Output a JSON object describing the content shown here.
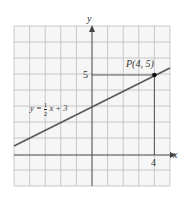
{
  "diagram": {
    "type": "line graph on coordinate grid",
    "axes": {
      "x_label": "x",
      "y_label": "y",
      "x_range": [
        -5,
        5
      ],
      "y_range": [
        -2,
        8
      ]
    },
    "equation": {
      "lhs": "y =",
      "frac_num": "1",
      "frac_den": "2",
      "rhs": "x + 3"
    },
    "point": {
      "label": "P(4, 5)",
      "x": 4,
      "y": 5
    },
    "ticks": {
      "x": "4",
      "y": "5"
    },
    "colors": {
      "grid": "#c8c8c8",
      "line": "#555555",
      "axis": "#444444",
      "point": "#111111",
      "guide": "#333333"
    }
  }
}
